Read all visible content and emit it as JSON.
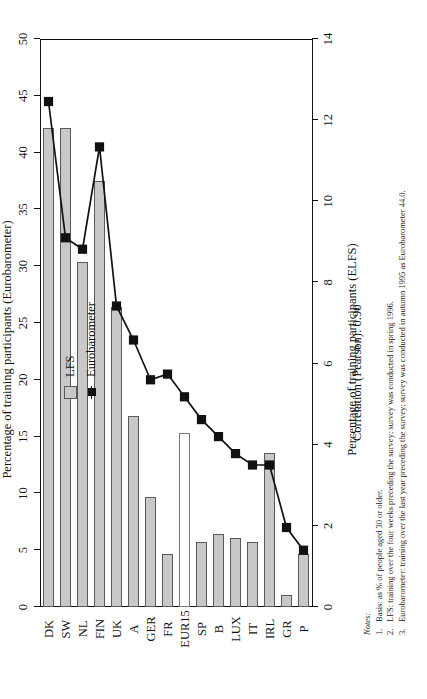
{
  "figure": {
    "legend": [
      {
        "key": "lfs",
        "label": "LFS",
        "marker": "gray-square",
        "color": "#c8c8c8"
      },
      {
        "key": "eurobarometer",
        "label": "Eurobarometer",
        "marker": "black-square-line",
        "color": "#111111"
      }
    ],
    "correlation_text": "Correlation (Pearson): 0.90",
    "notes_heading": "Notes:",
    "notes": [
      {
        "num": "1.",
        "text": "Basis: as % of people aged 30 or older."
      },
      {
        "num": "2.",
        "text": "LFS: training over the four weeks preceding the survey; survey was conducted in spring 1996."
      },
      {
        "num": "3.",
        "text": "Eurobarometer: training over the last year preceding the survey; survey was conducted in autumn 1995 as Eurobarometer 44.0."
      }
    ]
  },
  "chart_data": {
    "type": "bar",
    "title": "",
    "orientation": "rotated-90-ccw",
    "xlabel": "",
    "categories": [
      "DK",
      "SW",
      "NL",
      "FIN",
      "UK",
      "A",
      "GER",
      "FR",
      "EUR15",
      "SP",
      "B",
      "LUX",
      "IT",
      "IRL",
      "GR",
      "P"
    ],
    "grid": false,
    "legend_position": "top-right",
    "axes": {
      "bottom": {
        "label": "Percentage of training participants (ELFS)",
        "series": "lfs",
        "lim": [
          0,
          14
        ],
        "ticks": [
          0,
          2,
          4,
          6,
          8,
          10,
          12,
          14
        ],
        "ticklabels": [
          "0",
          "2",
          "4",
          "6",
          "8",
          "10",
          "12",
          "14"
        ]
      },
      "top": {
        "label": "Percentage of training participants (Eurobarometer)",
        "series": "eurobarometer",
        "lim": [
          0,
          50
        ],
        "ticks": [
          0,
          5,
          10,
          15,
          20,
          25,
          30,
          35,
          40,
          45,
          50
        ],
        "ticklabels": [
          "0",
          "5",
          "10",
          "15",
          "20",
          "25",
          "30",
          "35",
          "40",
          "45",
          "50"
        ]
      }
    },
    "series": [
      {
        "name": "LFS",
        "type": "bar",
        "axis": "bottom",
        "color": "#c8c8c8",
        "values": [
          11.8,
          11.8,
          8.5,
          10.5,
          7.4,
          4.7,
          2.7,
          1.3,
          4.3,
          1.6,
          1.8,
          1.7,
          1.6,
          3.8,
          0.3,
          1.3
        ],
        "highlight_index": 8,
        "highlight_style": "hollow-white-bar"
      },
      {
        "name": "Eurobarometer",
        "type": "line",
        "axis": "top",
        "color": "#111111",
        "marker": "filled-square",
        "values": [
          44.5,
          32.5,
          31.5,
          40.5,
          26.5,
          23.5,
          20.0,
          20.5,
          18.5,
          16.5,
          15.0,
          13.5,
          12.5,
          12.5,
          7.0,
          5.0
        ]
      }
    ]
  }
}
